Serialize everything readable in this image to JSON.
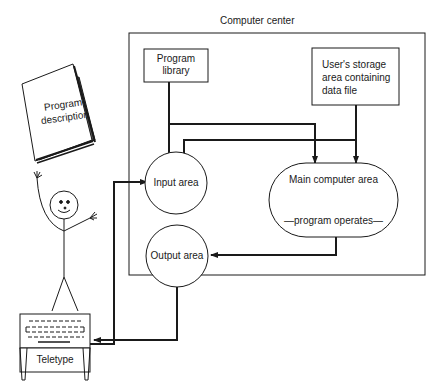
{
  "diagram": {
    "title": "Computer center",
    "nodes": {
      "program_library": {
        "line1": "Program",
        "line2": "library"
      },
      "user_storage": {
        "line1": "User's storage",
        "line2": "area containing",
        "line3": "data file"
      },
      "input_area": {
        "label": "Input area"
      },
      "output_area": {
        "label": "Output area"
      },
      "main_computer": {
        "label": "Main computer area",
        "sublabel": "—program operates—"
      },
      "program_description": {
        "line1": "Program",
        "line2": "description"
      },
      "teletype": {
        "label": "Teletype"
      }
    },
    "edges": [
      {
        "from": "program_library",
        "to": "main_computer"
      },
      {
        "from": "program_library",
        "to": "input_area"
      },
      {
        "from": "user_storage",
        "to": "main_computer"
      },
      {
        "from": "user_storage",
        "to": "input_area"
      },
      {
        "from": "teletype",
        "to": "input_area"
      },
      {
        "from": "main_computer",
        "to": "output_area"
      },
      {
        "from": "output_area",
        "to": "teletype"
      }
    ],
    "colors": {
      "ink": "#1a1a1a",
      "background": "#ffffff"
    }
  }
}
